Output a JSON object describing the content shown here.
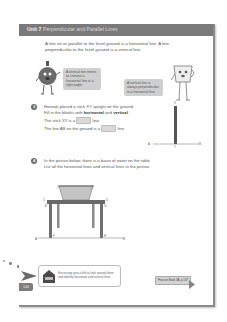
{
  "header": {
    "unit": "Unit 7",
    "title": "Perpendicular and Parallel Lines"
  },
  "intro": {
    "text": "A line on or parallel to the level ground is a horizontal line. A line perpendicular to the level ground is a vertical line."
  },
  "characters": [
    {
      "name": "round-character",
      "bubble": "A vertical line meets or crosses a horizontal line at a right angle."
    },
    {
      "name": "cup-character",
      "bubble": "A vertical line is always perpendicular to a horizontal line."
    }
  ],
  "question3": {
    "number": "3",
    "line1": "Hannah placed a stick XY upright on the ground.",
    "line2_prefix": "Fill in the blanks with ",
    "word1": "horizontal",
    "line2_and": " and ",
    "word2": "vertical",
    "line2_suffix": ".",
    "blank1_prefix": "The stick XY is a",
    "blank1_suffix": "line.",
    "blank2_prefix": "The line AB on the ground is a",
    "blank2_suffix": "line.",
    "diagram_labels": {
      "X": "X",
      "Y": "Y",
      "A": "A",
      "B": "B"
    }
  },
  "question4": {
    "number": "4",
    "line1": "In the picture below, there is a basin of water on the table.",
    "line2": "List all the horizontal lines and vertical lines in the picture.",
    "diagram_labels": {
      "I": "I",
      "J": "J",
      "C": "C",
      "D": "D",
      "E": "E",
      "G": "G",
      "F": "F",
      "H": "H",
      "A": "A",
      "B": "B"
    }
  },
  "footer": {
    "tip": "Encourage your child to look around them and identify horizontal and vertical lines.",
    "practice": "Practice Book 3A, p.137",
    "page_number": "140"
  },
  "colors": {
    "header_bar": "#7a7a7a",
    "bubble": "#cfcfcf",
    "blank": "#d9d9d9"
  }
}
